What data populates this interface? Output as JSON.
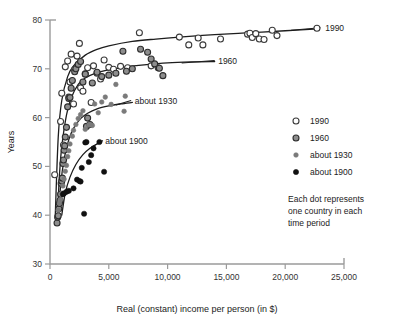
{
  "chart_data": {
    "type": "scatter",
    "title": "",
    "xlabel": "Real (constant) income per person (in $)",
    "ylabel": "Years",
    "xlim": [
      0,
      25000
    ],
    "ylim": [
      30,
      80
    ],
    "grid": false,
    "legend_position": "right",
    "xticks": [
      0,
      5000,
      10000,
      15000,
      20000,
      25000
    ],
    "xtick_labels": [
      "0",
      "5,000",
      "10,000",
      "15,000",
      "20,000",
      "25,000"
    ],
    "yticks": [
      30,
      40,
      50,
      60,
      70,
      80
    ],
    "ytick_labels": [
      "30",
      "40",
      "50",
      "60",
      "70",
      "80"
    ],
    "note": "Each dot represents one country in each time period",
    "note_lines": [
      "Each dot represents",
      "one country in each",
      "time period"
    ],
    "series": [
      {
        "name": "1990",
        "marker": "open-circle",
        "fill": "#ffffff",
        "stroke": "#3a3a3a",
        "radius": 3.0,
        "curve_label": "1990",
        "points": [
          [
            400,
            48.3
          ],
          [
            900,
            59.2
          ],
          [
            1000,
            65.0
          ],
          [
            1150,
            54.4
          ],
          [
            1300,
            70.4
          ],
          [
            1500,
            71.6
          ],
          [
            1600,
            64.2
          ],
          [
            1700,
            67.3
          ],
          [
            1800,
            73.0
          ],
          [
            2000,
            62.8
          ],
          [
            2100,
            69.9
          ],
          [
            2300,
            72.6
          ],
          [
            2500,
            75.2
          ],
          [
            2600,
            66.1
          ],
          [
            2800,
            65.4
          ],
          [
            3000,
            69.0
          ],
          [
            3200,
            70.2
          ],
          [
            3500,
            63.1
          ],
          [
            3700,
            70.6
          ],
          [
            4000,
            69.1
          ],
          [
            4300,
            67.9
          ],
          [
            4600,
            71.8
          ],
          [
            5000,
            70.3
          ],
          [
            5400,
            69.9
          ],
          [
            6000,
            70.5
          ],
          [
            6600,
            70.2
          ],
          [
            7600,
            77.4
          ],
          [
            8600,
            70.6
          ],
          [
            9200,
            70.2
          ],
          [
            11000,
            76.5
          ],
          [
            11800,
            74.9
          ],
          [
            12600,
            76.3
          ],
          [
            13000,
            74.9
          ],
          [
            14500,
            76.1
          ],
          [
            16800,
            77.1
          ],
          [
            17000,
            77.3
          ],
          [
            17200,
            76.4
          ],
          [
            17500,
            77.2
          ],
          [
            17800,
            76.1
          ],
          [
            18200,
            76.0
          ],
          [
            18900,
            77.9
          ],
          [
            19300,
            76.8
          ],
          [
            22700,
            78.3
          ]
        ],
        "curve": [
          [
            450,
            40.0
          ],
          [
            700,
            56.0
          ],
          [
            1000,
            63.5
          ],
          [
            1500,
            68.4
          ],
          [
            2000,
            70.6
          ],
          [
            3000,
            72.8
          ],
          [
            4000,
            74.0
          ],
          [
            5000,
            74.7
          ],
          [
            7000,
            75.6
          ],
          [
            9000,
            76.1
          ],
          [
            11000,
            76.5
          ],
          [
            14000,
            77.0
          ],
          [
            17000,
            77.4
          ],
          [
            20000,
            77.8
          ],
          [
            22800,
            78.2
          ]
        ]
      },
      {
        "name": "1960",
        "marker": "gray-circle",
        "fill": "#8d8d8d",
        "stroke": "#2d2d2d",
        "radius": 3.0,
        "curve_label": "1960",
        "points": [
          [
            600,
            38.4
          ],
          [
            650,
            39.6
          ],
          [
            700,
            39.9
          ],
          [
            750,
            41.3
          ],
          [
            800,
            42.4
          ],
          [
            850,
            43.0
          ],
          [
            900,
            44.3
          ],
          [
            950,
            46.5
          ],
          [
            1000,
            47.0
          ],
          [
            1050,
            47.6
          ],
          [
            1100,
            50.6
          ],
          [
            1150,
            51.3
          ],
          [
            1200,
            53.3
          ],
          [
            1250,
            54.2
          ],
          [
            1300,
            56.0
          ],
          [
            1400,
            58.0
          ],
          [
            1500,
            62.2
          ],
          [
            1600,
            63.9
          ],
          [
            1700,
            64.1
          ],
          [
            1800,
            66.0
          ],
          [
            1900,
            67.6
          ],
          [
            2100,
            69.4
          ],
          [
            2200,
            70.0
          ],
          [
            2400,
            70.9
          ],
          [
            2600,
            71.5
          ],
          [
            2800,
            67.3
          ],
          [
            3000,
            68.9
          ],
          [
            3100,
            58.2
          ],
          [
            3200,
            59.9
          ],
          [
            3400,
            58.6
          ],
          [
            3600,
            67.1
          ],
          [
            4000,
            69.3
          ],
          [
            4400,
            68.4
          ],
          [
            5000,
            68.7
          ],
          [
            5600,
            69.1
          ],
          [
            6200,
            73.6
          ],
          [
            6500,
            69.5
          ],
          [
            7000,
            70.0
          ],
          [
            7700,
            74.0
          ],
          [
            8300,
            73.4
          ],
          [
            8600,
            72.0
          ],
          [
            8900,
            71.0
          ],
          [
            9300,
            70.1
          ],
          [
            9600,
            68.6
          ]
        ],
        "curve": [
          [
            600,
            38.0
          ],
          [
            800,
            48.0
          ],
          [
            1000,
            54.0
          ],
          [
            1400,
            60.5
          ],
          [
            1800,
            64.0
          ],
          [
            2400,
            66.8
          ],
          [
            3000,
            68.1
          ],
          [
            4000,
            69.2
          ],
          [
            5000,
            69.8
          ],
          [
            6500,
            70.4
          ],
          [
            8000,
            70.8
          ],
          [
            10000,
            71.2
          ],
          [
            12000,
            71.4
          ],
          [
            14000,
            71.5
          ]
        ]
      },
      {
        "name": "about 1930",
        "marker": "small-gray-dot",
        "fill": "#7a7a7a",
        "stroke": "#7a7a7a",
        "radius": 2.3,
        "curve_label": "about 1930",
        "points": [
          [
            700,
            41.0
          ],
          [
            800,
            42.5
          ],
          [
            900,
            43.2
          ],
          [
            1000,
            44.5
          ],
          [
            1100,
            46.0
          ],
          [
            1200,
            47.4
          ],
          [
            1300,
            49.0
          ],
          [
            1400,
            50.2
          ],
          [
            1500,
            52.0
          ],
          [
            1600,
            53.2
          ],
          [
            1700,
            54.6
          ],
          [
            1900,
            56.2
          ],
          [
            2000,
            57.4
          ],
          [
            2200,
            58.6
          ],
          [
            2400,
            59.8
          ],
          [
            2600,
            60.6
          ],
          [
            2800,
            61.4
          ],
          [
            3000,
            57.6
          ],
          [
            3300,
            58.5
          ],
          [
            3600,
            58.4
          ],
          [
            3800,
            62.8
          ],
          [
            4100,
            61.0
          ],
          [
            4400,
            63.2
          ],
          [
            4700,
            64.2
          ],
          [
            5200,
            62.7
          ],
          [
            5600,
            66.8
          ],
          [
            6300,
            61.3
          ],
          [
            6400,
            64.4
          ]
        ],
        "curve": [
          [
            700,
            38.5
          ],
          [
            900,
            46.0
          ],
          [
            1200,
            51.5
          ],
          [
            1600,
            55.5
          ],
          [
            2000,
            57.8
          ],
          [
            2600,
            59.8
          ],
          [
            3200,
            60.9
          ],
          [
            4000,
            61.8
          ],
          [
            5000,
            62.4
          ],
          [
            6000,
            62.8
          ],
          [
            7000,
            63.1
          ]
        ]
      },
      {
        "name": "about 1900",
        "marker": "black-dot",
        "fill": "#111111",
        "stroke": "#111111",
        "radius": 2.6,
        "curve_label": "about 1900",
        "points": [
          [
            1100,
            44.3
          ],
          [
            1200,
            44.5
          ],
          [
            1400,
            44.8
          ],
          [
            1600,
            45.0
          ],
          [
            2000,
            45.5
          ],
          [
            2300,
            47.3
          ],
          [
            2500,
            47.0
          ],
          [
            2600,
            46.9
          ],
          [
            2700,
            49.7
          ],
          [
            2900,
            40.3
          ],
          [
            3000,
            54.9
          ],
          [
            3100,
            55.0
          ],
          [
            3300,
            50.9
          ],
          [
            3500,
            52.3
          ],
          [
            3700,
            53.7
          ],
          [
            4200,
            55.0
          ],
          [
            4600,
            48.9
          ]
        ],
        "curve": [
          [
            1000,
            40.0
          ],
          [
            1300,
            44.6
          ],
          [
            1700,
            47.8
          ],
          [
            2200,
            50.4
          ],
          [
            2800,
            52.4
          ],
          [
            3400,
            53.7
          ],
          [
            4000,
            54.6
          ],
          [
            4400,
            55.0
          ]
        ]
      }
    ],
    "curve_labels": [
      {
        "text": "1990",
        "x": 23400,
        "y": 78.4
      },
      {
        "text": "1960",
        "x": 14300,
        "y": 71.5
      },
      {
        "text": "about 1930",
        "x": 7200,
        "y": 63.3
      },
      {
        "text": "about 1900",
        "x": 4700,
        "y": 55.2
      }
    ]
  },
  "legend": {
    "entries": [
      {
        "label": "1990",
        "marker": "open-circle"
      },
      {
        "label": "1960",
        "marker": "gray-circle"
      },
      {
        "label": "about 1930",
        "marker": "small-gray-dot"
      },
      {
        "label": "about 1900",
        "marker": "black-dot"
      }
    ]
  }
}
